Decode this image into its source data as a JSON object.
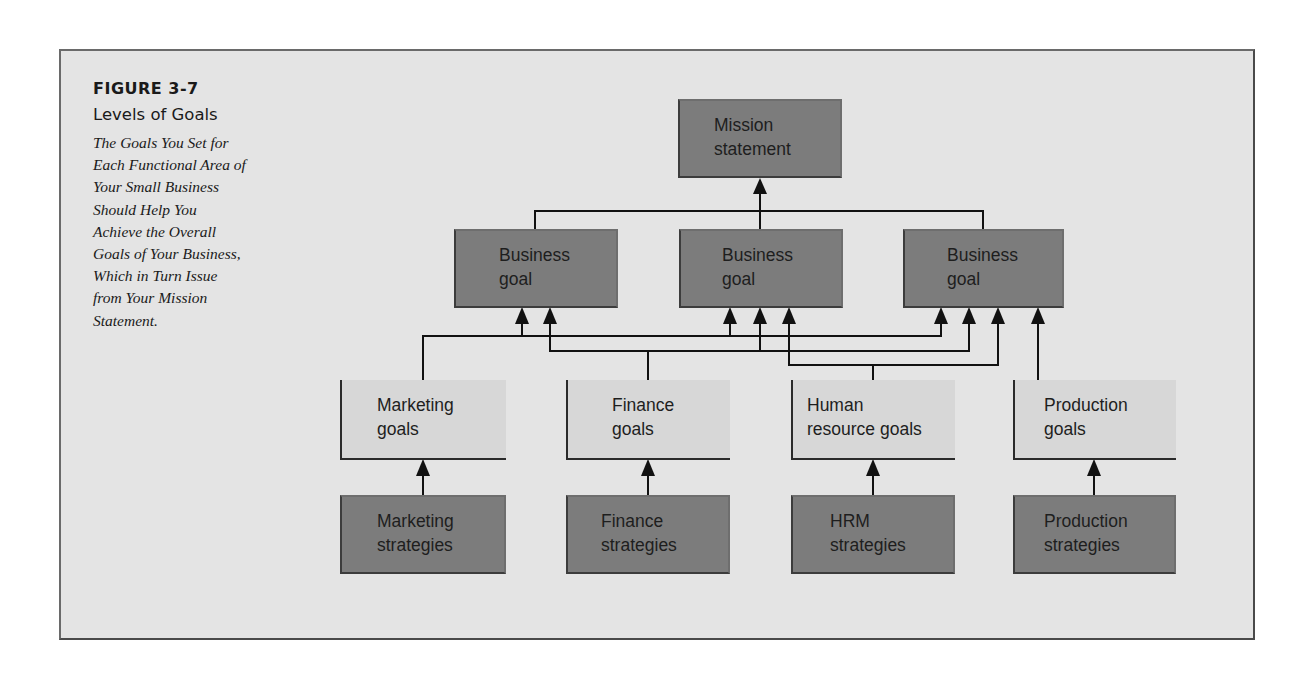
{
  "figure": {
    "number": "FIGURE 3-7",
    "title": "Levels of Goals",
    "description_lines": [
      "The Goals You Set for",
      "Each Functional Area of",
      "Your Small Business",
      "Should Help You",
      "Achieve the Overall",
      "Goals of Your Business,",
      "Which in Turn Issue",
      "from Your Mission",
      "Statement."
    ]
  },
  "colors": {
    "background": "#e4e4e4",
    "dark_box": "#7c7c7c",
    "light_box": "#d7d7d7",
    "line": "#111111"
  },
  "diagram": {
    "mission": {
      "lines": [
        "Mission",
        "statement"
      ]
    },
    "business_goals": [
      {
        "lines": [
          "Business",
          "goal"
        ]
      },
      {
        "lines": [
          "Business",
          "goal"
        ]
      },
      {
        "lines": [
          "Business",
          "goal"
        ]
      }
    ],
    "functional_goals": [
      {
        "lines": [
          "Marketing",
          "goals"
        ]
      },
      {
        "lines": [
          "Finance",
          "goals"
        ]
      },
      {
        "lines": [
          "Human",
          "resource goals"
        ]
      },
      {
        "lines": [
          "Production",
          "goals"
        ]
      }
    ],
    "strategies": [
      {
        "lines": [
          "Marketing",
          "strategies"
        ]
      },
      {
        "lines": [
          "Finance",
          "strategies"
        ]
      },
      {
        "lines": [
          "HRM",
          "strategies"
        ]
      },
      {
        "lines": [
          "Production",
          "strategies"
        ]
      }
    ]
  }
}
